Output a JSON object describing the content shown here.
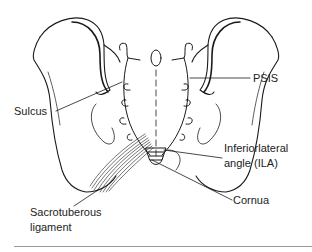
{
  "diagram": {
    "labels": {
      "psis": "PSIS",
      "sulcus": "Sulcus",
      "ila_line1": "Inferiorlateral",
      "ila_line2": "angle (ILA)",
      "cornua": "Cornua",
      "sacrotuberous_line1": "Sacrotuberous",
      "sacrotuberous_line2": "ligament"
    },
    "colors": {
      "line": "#1a1a1a",
      "text": "#222222",
      "rule": "#999999"
    }
  }
}
